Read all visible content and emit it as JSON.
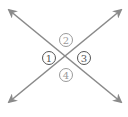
{
  "diagram": {
    "colors": {
      "line": "#8a8a8a",
      "circle_dark": "#555555",
      "circle_light": "#9a9a9a",
      "background": "#ffffff"
    },
    "lines": [
      {
        "name": "line-descending",
        "x1": 9,
        "y1": 10,
        "x2": 121,
        "y2": 102
      },
      {
        "name": "line-ascending",
        "x1": 9,
        "y1": 102,
        "x2": 121,
        "y2": 10
      }
    ],
    "intersection": {
      "x": 66,
      "y": 58
    },
    "angles": [
      {
        "label": "1",
        "cx": 49,
        "cy": 58,
        "tone": "dark"
      },
      {
        "label": "2",
        "cx": 66,
        "cy": 40,
        "tone": "light"
      },
      {
        "label": "3",
        "cx": 84,
        "cy": 58,
        "tone": "dark"
      },
      {
        "label": "4",
        "cx": 66,
        "cy": 75,
        "tone": "light"
      }
    ]
  }
}
